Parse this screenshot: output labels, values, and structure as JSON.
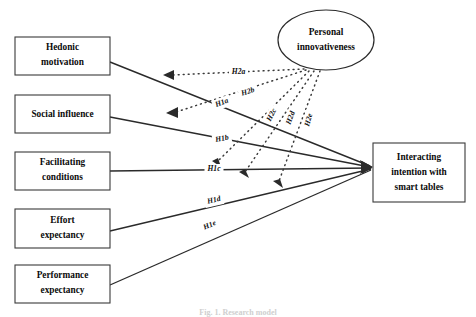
{
  "figure": {
    "type": "research-model-path-diagram",
    "caption": "Fig. 1. Research model",
    "background_color": "#ffffff",
    "line_color": "#2a2a2a",
    "box_fill": "#ffffff",
    "text_color": "#0b0b0b"
  },
  "nodes": {
    "predictors": [
      {
        "id": "hedonic-motivation",
        "label": "Hedonic\nmotivation",
        "line1": "Hedonic",
        "line2": "motivation",
        "shape": "rect",
        "x": 15,
        "y": 37,
        "w": 95,
        "h": 38
      },
      {
        "id": "social-influence",
        "label": "Social influence",
        "line1": "Social influence",
        "line2": "",
        "shape": "rect",
        "x": 15,
        "y": 95,
        "w": 95,
        "h": 38
      },
      {
        "id": "facilitating-conditions",
        "label": "Facilitating\nconditions",
        "line1": "Facilitating",
        "line2": "conditions",
        "shape": "rect",
        "x": 15,
        "y": 152,
        "w": 95,
        "h": 38
      },
      {
        "id": "effort-expectancy",
        "label": "Effort\nexpectancy",
        "line1": "Effort",
        "line2": "expectancy",
        "shape": "rect",
        "x": 15,
        "y": 209,
        "w": 95,
        "h": 39
      },
      {
        "id": "performance-expectancy",
        "label": "Performance\nexpectancy",
        "line1": "Performance",
        "line2": "expectancy",
        "shape": "rect",
        "x": 15,
        "y": 265,
        "w": 95,
        "h": 38
      }
    ],
    "moderator": {
      "id": "personal-innovativeness",
      "label": "Personal innovativeness",
      "line1": "Personal",
      "line2": "innovativeness",
      "shape": "ellipse",
      "cx": 326,
      "cy": 40,
      "rx": 48,
      "ry": 30
    },
    "outcome": {
      "id": "interacting-intention-with-smart-tables",
      "label": "Interacting intention with smart tables",
      "line1": "Interacting",
      "line2": "intention with",
      "line3": "smart tables",
      "shape": "rect",
      "x": 373,
      "y": 143,
      "w": 92,
      "h": 59
    }
  },
  "paths": {
    "direct": [
      {
        "id": "H1a",
        "label": "H1a",
        "from": "hedonic-motivation",
        "to": "interacting-intention-with-smart-tables",
        "style": "solid",
        "x1": 110,
        "y1": 62,
        "x2": 370,
        "y2": 166,
        "lx": 222,
        "ly": 103
      },
      {
        "id": "H1b",
        "label": "H1b",
        "from": "social-influence",
        "to": "interacting-intention-with-smart-tables",
        "style": "solid",
        "x1": 110,
        "y1": 117,
        "x2": 370,
        "y2": 167,
        "lx": 222,
        "ly": 139
      },
      {
        "id": "H1c",
        "label": "H1c",
        "from": "facilitating-conditions",
        "to": "interacting-intention-with-smart-tables",
        "style": "solid",
        "x1": 110,
        "y1": 171,
        "x2": 370,
        "y2": 168,
        "lx": 214,
        "ly": 169
      },
      {
        "id": "H1d",
        "label": "H1d",
        "from": "effort-expectancy",
        "to": "interacting-intention-with-smart-tables",
        "style": "solid",
        "x1": 110,
        "y1": 231,
        "x2": 371,
        "y2": 169,
        "lx": 214,
        "ly": 200
      },
      {
        "id": "H1e",
        "label": "H1e",
        "from": "performance-expectancy",
        "to": "interacting-intention-with-smart-tables",
        "style": "solid",
        "x1": 110,
        "y1": 285,
        "x2": 371,
        "y2": 170,
        "lx": 210,
        "ly": 225
      }
    ],
    "moderation": [
      {
        "id": "H2a",
        "label": "H2a",
        "from": "personal-innovativeness",
        "to": "H1a",
        "style": "dotted",
        "x1": 304,
        "y1": 69,
        "x2": 168,
        "y2": 75,
        "lx": 238,
        "ly": 72,
        "rot": 0,
        "head": "left"
      },
      {
        "id": "H2b",
        "label": "H2b",
        "from": "personal-innovativeness",
        "to": "H1b",
        "style": "dotted",
        "x1": 306,
        "y1": 70,
        "x2": 172,
        "y2": 112,
        "lx": 248,
        "ly": 92,
        "rot": -17,
        "head": "left"
      },
      {
        "id": "H2c",
        "label": "H2c",
        "from": "personal-innovativeness",
        "to": "H1c",
        "style": "dotted",
        "x1": 309,
        "y1": 71,
        "x2": 215,
        "y2": 166,
        "lx": 272,
        "ly": 115,
        "rot": -63,
        "head": "down"
      },
      {
        "id": "H2d",
        "label": "H2d",
        "from": "personal-innovativeness",
        "to": "H1d",
        "style": "dotted",
        "x1": 314,
        "y1": 71,
        "x2": 243,
        "y2": 176,
        "lx": 291,
        "ly": 118,
        "rot": -70,
        "head": "down"
      },
      {
        "id": "H2e",
        "label": "H2e",
        "from": "personal-innovativeness",
        "to": "H1e",
        "style": "dotted",
        "x1": 320,
        "y1": 71,
        "x2": 277,
        "y2": 185,
        "lx": 309,
        "ly": 120,
        "rot": -74,
        "head": "down"
      }
    ]
  },
  "legend": {
    "solid_meaning": "direct effect",
    "dotted_meaning": "moderating effect"
  }
}
